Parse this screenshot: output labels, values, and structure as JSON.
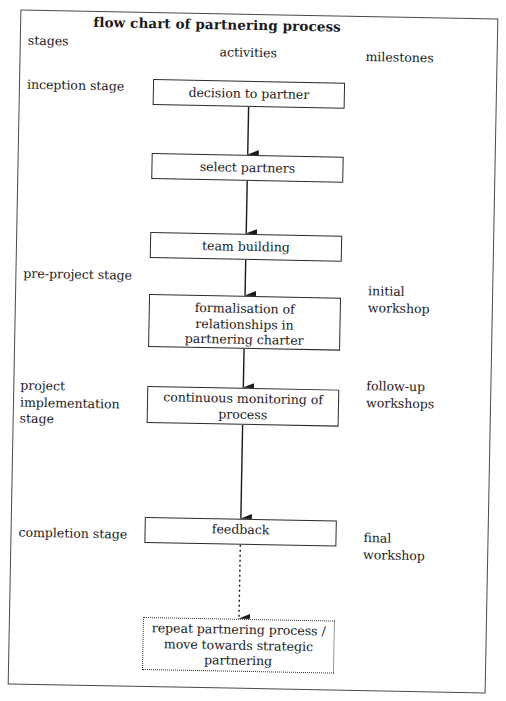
{
  "title": "flow chart of partnering process",
  "columns": {
    "stages": "stages",
    "activities": "activities",
    "milestones": "milestones"
  },
  "stages": [
    {
      "lines": [
        "inception stage"
      ]
    },
    {
      "lines": [
        "pre-project stage"
      ]
    },
    {
      "lines": [
        "project",
        "implementation",
        "stage"
      ]
    },
    {
      "lines": [
        "completion stage"
      ]
    }
  ],
  "activities": [
    {
      "lines": [
        "decision to partner"
      ],
      "style": "solid"
    },
    {
      "lines": [
        "select partners"
      ],
      "style": "solid"
    },
    {
      "lines": [
        "team building"
      ],
      "style": "solid"
    },
    {
      "lines": [
        "formalisation of relationships in",
        "partnering charter"
      ],
      "style": "solid"
    },
    {
      "lines": [
        "continuous monitoring of",
        "process"
      ],
      "style": "solid"
    },
    {
      "lines": [
        "feedback"
      ],
      "style": "solid"
    },
    {
      "lines": [
        "repeat partnering process /",
        "move towards strategic",
        "partnering"
      ],
      "style": "dotted"
    }
  ],
  "milestones": [
    {
      "lines": [
        "initial",
        "workshop"
      ]
    },
    {
      "lines": [
        "follow-up",
        "workshops"
      ]
    },
    {
      "lines": [
        "final",
        "workshop"
      ]
    }
  ],
  "connectors": [
    {
      "from": 0,
      "to": 1,
      "style": "solid"
    },
    {
      "from": 1,
      "to": 2,
      "style": "solid"
    },
    {
      "from": 2,
      "to": 3,
      "style": "solid"
    },
    {
      "from": 3,
      "to": 4,
      "style": "solid"
    },
    {
      "from": 4,
      "to": 5,
      "style": "solid"
    },
    {
      "from": 5,
      "to": 6,
      "style": "dotted"
    }
  ]
}
